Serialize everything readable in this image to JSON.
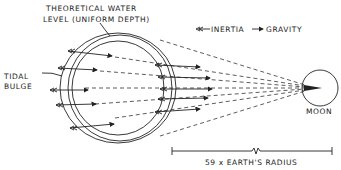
{
  "diagram": {
    "labels": {
      "theoretical_line1": "THEORETICAL WATER",
      "theoretical_line2": "LEVEL (UNIFORM DEPTH)",
      "tidal_line1": "TIDAL",
      "tidal_line2": "BULGE",
      "moon": "MOON",
      "distance": "59 x EARTH'S RADIUS"
    },
    "legend": {
      "inertia": "INERTIA",
      "gravity": "GRAVITY",
      "inertia_symbol": "double-arrow-left-icon",
      "gravity_symbol": "arrow-right-icon"
    },
    "colors": {
      "ink": "#222222",
      "background": "#ffffff"
    }
  }
}
